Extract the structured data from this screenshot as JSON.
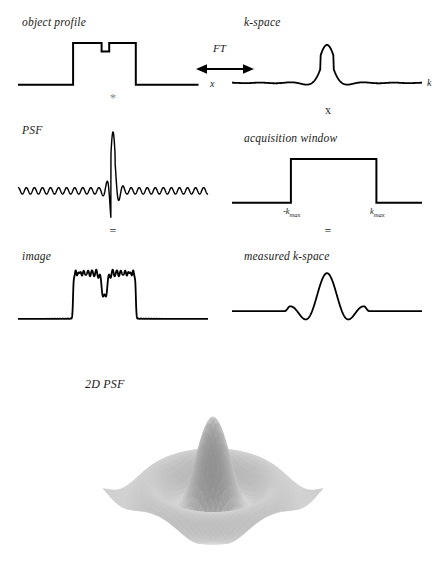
{
  "figure": {
    "row_labels": {
      "object_profile": "object profile",
      "k_space": "k-space",
      "psf": "PSF",
      "acquisition_window": "acquisition window",
      "image": "image",
      "measured_k_space": "measured k-space",
      "two_d_psf": "2D PSF"
    },
    "axis_labels": {
      "x": "x",
      "k": "k",
      "neg_kmax": "-k",
      "neg_kmax_sub": "max",
      "kmax": "k",
      "kmax_sub": "max"
    },
    "operators": {
      "transform": "FT",
      "convolution": "*",
      "multiplication": "x",
      "equals_left": "=",
      "equals_right": "="
    },
    "colors": {
      "curve": "#000000",
      "text": "#1a1a1a",
      "faint_operator": "#8a8a8a",
      "background": "#ffffff",
      "surface_light": "#e8e8e8",
      "surface_mid": "#a8a8a8",
      "surface_dark": "#6e6e6e"
    }
  },
  "chart_data": [
    {
      "type": "line",
      "name": "object-profile",
      "title": "object profile",
      "xlabel": "x",
      "ylabel": "",
      "description": "Rect (boxcar) function with a narrow notch cut into the top center",
      "xlim": [
        0,
        200
      ],
      "ylim": [
        0,
        1
      ],
      "points": [
        [
          0,
          0
        ],
        [
          58,
          0
        ],
        [
          58,
          1
        ],
        [
          88,
          1
        ],
        [
          88,
          0.78
        ],
        [
          96,
          0.78
        ],
        [
          96,
          1
        ],
        [
          124,
          1
        ],
        [
          124,
          0
        ],
        [
          200,
          0
        ]
      ]
    },
    {
      "type": "line",
      "name": "k-space",
      "title": "k-space",
      "xlabel": "k",
      "ylabel": "",
      "description": "Fourier transform of the notched rect: sinc-like central lobe with decaying oscillating tails",
      "xlim": [
        0,
        200
      ],
      "ylim": [
        -0.35,
        1
      ],
      "central_peak_x": 100,
      "central_peak_value": 1.0,
      "oscillation_periods": 18,
      "tail_amplitude": 0.12
    },
    {
      "type": "line",
      "name": "psf",
      "title": "PSF",
      "xlabel": "",
      "ylabel": "",
      "description": "Point spread function: very tall narrow central spike with high-frequency decaying sidelobes",
      "xlim": [
        0,
        200
      ],
      "ylim": [
        -1,
        1
      ],
      "central_peak_x": 100,
      "central_peak_value": 1.0,
      "oscillation_periods": 44,
      "tail_amplitude": 0.07
    },
    {
      "type": "line",
      "name": "acquisition-window",
      "title": "acquisition window",
      "xlabel": "k",
      "ylabel": "",
      "description": "Boxcar window between -kmax and +kmax",
      "xlim": [
        0,
        200
      ],
      "ylim": [
        0,
        1
      ],
      "kmax_left_x": 62,
      "kmax_right_x": 152,
      "points": [
        [
          0,
          0
        ],
        [
          62,
          0
        ],
        [
          62,
          1
        ],
        [
          152,
          1
        ],
        [
          152,
          0
        ],
        [
          200,
          0
        ]
      ]
    },
    {
      "type": "line",
      "name": "image",
      "title": "image",
      "xlabel": "",
      "ylabel": "",
      "description": "Blurred object profile showing Gibbs ringing: broadened box with oscillating top, softened notch and ripple tails",
      "xlim": [
        0,
        200
      ],
      "ylim": [
        0,
        1
      ],
      "plateau_left_x": 58,
      "plateau_right_x": 124,
      "ringing_amplitude": 0.12
    },
    {
      "type": "line",
      "name": "measured-k-space",
      "title": "measured k-space",
      "xlabel": "",
      "ylabel": "",
      "description": "k-space signal truncated by the acquisition window: central peak with a few sidelobes, flat zero outside kmax",
      "xlim": [
        0,
        200
      ],
      "ylim": [
        -0.35,
        1
      ],
      "central_peak_x": 100,
      "central_peak_value": 1.0,
      "truncation_left_x": 55,
      "truncation_right_x": 145,
      "oscillation_periods": 8
    },
    {
      "type": "heatmap",
      "name": "two-d-psf-surface",
      "title": "2D PSF",
      "description": "Grayscale shaded 3D surface render of the two-dimensional point spread function: a tall central peak surrounded by concentric ripple ridges and troughs on a square base",
      "xlabel": "",
      "ylabel": "",
      "peak_height": 1.0,
      "ring_count": 2,
      "colormap": "grayscale"
    }
  ]
}
